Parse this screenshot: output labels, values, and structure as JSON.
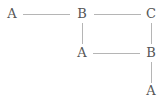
{
  "diagram": {
    "type": "tree",
    "nodes": [
      {
        "id": "n1",
        "label": "A",
        "x": 12,
        "y": 14
      },
      {
        "id": "n2",
        "label": "B",
        "x": 82,
        "y": 14
      },
      {
        "id": "n3",
        "label": "C",
        "x": 151,
        "y": 14
      },
      {
        "id": "n4",
        "label": "A",
        "x": 82,
        "y": 53
      },
      {
        "id": "n5",
        "label": "B",
        "x": 151,
        "y": 53
      },
      {
        "id": "n6",
        "label": "A",
        "x": 151,
        "y": 91
      }
    ],
    "edges": [
      {
        "from": "n1",
        "to": "n2"
      },
      {
        "from": "n2",
        "to": "n3"
      },
      {
        "from": "n2",
        "to": "n4"
      },
      {
        "from": "n4",
        "to": "n5"
      },
      {
        "from": "n3",
        "to": "n5"
      },
      {
        "from": "n5",
        "to": "n6"
      }
    ],
    "colors": {
      "text": "#555555",
      "line": "#b5b5b5",
      "background": "#ffffff"
    }
  }
}
